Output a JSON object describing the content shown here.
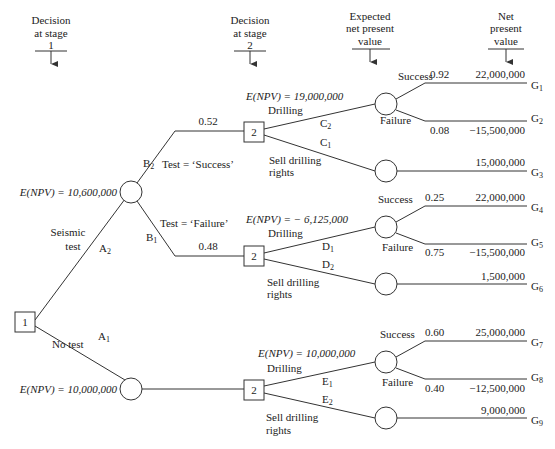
{
  "headers": {
    "stage1": [
      "Decision",
      "at stage",
      "1"
    ],
    "stage2": [
      "Decision",
      "at stage",
      "2"
    ],
    "expected": [
      "Expected",
      "net present",
      "value"
    ],
    "npv": [
      "Net",
      "present",
      "value"
    ]
  },
  "root": {
    "label": "1"
  },
  "stage1_branches": {
    "seismic": {
      "label_line1": "Seismic",
      "label_line2": "test",
      "code": "A",
      "code_sub": "2",
      "enpv": "E(NPV) = 10,600,000"
    },
    "no_test": {
      "label": "No test",
      "code": "A",
      "code_sub": "1",
      "enpv": "E(NPV) = 10,000,000"
    }
  },
  "test_outcomes": {
    "success": {
      "code": "B",
      "code_sub": "2",
      "label": "Test = ‘Success’",
      "prob": "0.52"
    },
    "failure": {
      "code": "B",
      "code_sub": "1",
      "label": "Test = ‘Failure’",
      "prob": "0.48"
    }
  },
  "stage2_nodes": [
    {
      "label": "2",
      "enpv": "E(NPV) = 19,000,000",
      "drill": {
        "label": "Drilling",
        "code": "C",
        "code_sub": "2"
      },
      "sell": {
        "label_line1": "Sell drilling",
        "label_line2": "rights",
        "code": "C",
        "code_sub": "1"
      },
      "outcomes": [
        {
          "name": "Success",
          "prob": "0.92",
          "value": "22,000,000",
          "g": "G",
          "g_sub": "1"
        },
        {
          "name": "Failure",
          "prob": "0.08",
          "value": "−15,500,000",
          "g": "G",
          "g_sub": "2"
        },
        {
          "name": "",
          "prob": "",
          "value": "15,000,000",
          "g": "G",
          "g_sub": "3"
        }
      ]
    },
    {
      "label": "2",
      "enpv": "E(NPV) = − 6,125,000",
      "drill": {
        "label": "Drilling",
        "code": "D",
        "code_sub": "1"
      },
      "sell": {
        "label_line1": "Sell drilling",
        "label_line2": "rights",
        "code": "D",
        "code_sub": "2"
      },
      "outcomes": [
        {
          "name": "Success",
          "prob": "0.25",
          "value": "22,000,000",
          "g": "G",
          "g_sub": "4"
        },
        {
          "name": "Failure",
          "prob": "0.75",
          "value": "−15,500,000",
          "g": "G",
          "g_sub": "5"
        },
        {
          "name": "",
          "prob": "",
          "value": "1,500,000",
          "g": "G",
          "g_sub": "6"
        }
      ]
    },
    {
      "label": "2",
      "enpv": "E(NPV) = 10,000,000",
      "drill": {
        "label": "Drilling",
        "code": "E",
        "code_sub": "1"
      },
      "sell": {
        "label_line1": "Sell drilling",
        "label_line2": "rights",
        "code": "E",
        "code_sub": "2"
      },
      "outcomes": [
        {
          "name": "Success",
          "prob": "0.60",
          "value": "25,000,000",
          "g": "G",
          "g_sub": "7"
        },
        {
          "name": "Failure",
          "prob": "0.40",
          "value": "−12,500,000",
          "g": "G",
          "g_sub": "8"
        },
        {
          "name": "",
          "prob": "",
          "value": "9,000,000",
          "g": "G",
          "g_sub": "9"
        }
      ]
    }
  ]
}
